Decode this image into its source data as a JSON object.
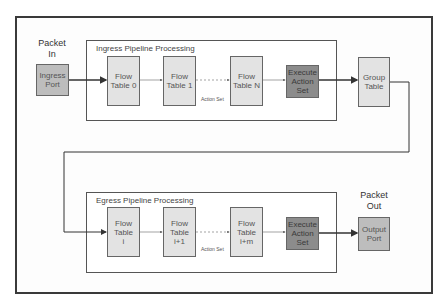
{
  "diagram": {
    "colors": {
      "flow_table": "#e3e3e3",
      "port": "#bdbdbd",
      "execute": "#8c8c8c",
      "line": "#444444"
    },
    "packet_in_label": "Packet\nIn",
    "packet_out_label": "Packet\nOut",
    "ingress": {
      "title": "Ingress Pipeline Processing",
      "port": "Ingress\nPort",
      "tables": [
        "Flow\nTable 0",
        "Flow\nTable 1",
        "Flow\nTable N"
      ],
      "action_set_label": "Action Set",
      "execute": "Execute\nAction\nSet"
    },
    "group_table": "Group\nTable",
    "egress": {
      "title": "Egress Pipeline Processing",
      "tables": [
        "Flow\nTable\ni",
        "Flow\nTable\ni+1",
        "Flow\nTable\ni+m"
      ],
      "action_set_label": "Action Set",
      "execute": "Execute\nAction\nSet",
      "port": "Output\nPort"
    }
  }
}
